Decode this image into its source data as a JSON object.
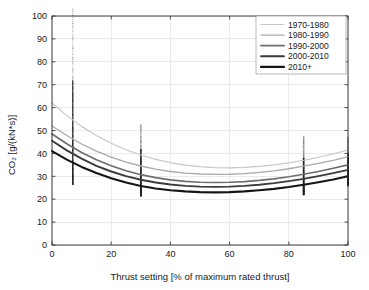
{
  "chart_data": {
    "type": "line",
    "title": "",
    "xlabel": "Thrust setting [% of maximum rated thrust]",
    "ylabel": "CO2 [g/(kN*s)]",
    "ylabel_display": "CO₂ [g/(kN*s)]",
    "xlim": [
      0,
      100
    ],
    "ylim": [
      0,
      100
    ],
    "xticks": [
      0,
      20,
      40,
      60,
      80,
      100
    ],
    "yticks": [
      0,
      10,
      20,
      30,
      40,
      50,
      60,
      70,
      80,
      90,
      100
    ],
    "xtick_labels": [
      "0",
      "20",
      "40",
      "60",
      "80",
      "100"
    ],
    "ytick_labels": [
      "0",
      "10",
      "20",
      "30",
      "40",
      "50",
      "60",
      "70",
      "80",
      "90",
      "100"
    ],
    "grid": true,
    "grid_color": "#d8d8d8",
    "legend_position": "top-right",
    "series": [
      {
        "name": "1970-1980",
        "color": "#c8c8c8",
        "width": 1.2,
        "x": [
          0,
          5,
          10,
          15,
          20,
          25,
          30,
          35,
          40,
          45,
          50,
          55,
          60,
          65,
          70,
          75,
          80,
          85,
          90,
          95,
          100
        ],
        "values": [
          62.0,
          56.5,
          51.8,
          47.8,
          44.4,
          41.6,
          39.3,
          37.4,
          36.0,
          34.9,
          34.2,
          33.8,
          33.7,
          33.9,
          34.3,
          35.0,
          35.9,
          37.0,
          38.3,
          39.8,
          41.5
        ]
      },
      {
        "name": "1980-1990",
        "color": "#aaaaaa",
        "width": 1.3,
        "x": [
          0,
          5,
          10,
          15,
          20,
          25,
          30,
          35,
          40,
          45,
          50,
          55,
          60,
          65,
          70,
          75,
          80,
          85,
          90,
          95,
          100
        ],
        "values": [
          52.0,
          47.8,
          44.1,
          41.0,
          38.4,
          36.2,
          34.5,
          33.1,
          32.1,
          31.4,
          31.0,
          30.8,
          30.9,
          31.2,
          31.7,
          32.4,
          33.3,
          34.4,
          35.6,
          37.0,
          38.6
        ]
      },
      {
        "name": "1990-2000",
        "color": "#6e6e6e",
        "width": 1.7,
        "x": [
          0,
          5,
          10,
          15,
          20,
          25,
          30,
          35,
          40,
          45,
          50,
          55,
          60,
          65,
          70,
          75,
          80,
          85,
          90,
          95,
          100
        ],
        "values": [
          48.5,
          44.2,
          40.4,
          37.2,
          34.6,
          32.4,
          30.7,
          29.4,
          28.4,
          27.8,
          27.4,
          27.3,
          27.4,
          27.7,
          28.2,
          28.9,
          29.8,
          30.9,
          32.1,
          33.5,
          35.0
        ]
      },
      {
        "name": "2000-2010",
        "color": "#3c3c3c",
        "width": 1.9,
        "x": [
          0,
          5,
          10,
          15,
          20,
          25,
          30,
          35,
          40,
          45,
          50,
          55,
          60,
          65,
          70,
          75,
          80,
          85,
          90,
          95,
          100
        ],
        "values": [
          45.5,
          41.3,
          37.7,
          34.6,
          32.1,
          30.1,
          28.5,
          27.3,
          26.4,
          25.8,
          25.5,
          25.4,
          25.5,
          25.8,
          26.3,
          27.0,
          27.9,
          28.9,
          30.1,
          31.4,
          32.8
        ]
      },
      {
        "name": "2010+",
        "color": "#151515",
        "width": 2.1,
        "x": [
          0,
          5,
          10,
          15,
          20,
          25,
          30,
          35,
          40,
          45,
          50,
          55,
          60,
          65,
          70,
          75,
          80,
          85,
          90,
          95,
          100
        ],
        "values": [
          41.0,
          37.3,
          34.1,
          31.4,
          29.1,
          27.3,
          25.8,
          24.7,
          23.9,
          23.4,
          23.1,
          23.0,
          23.1,
          23.4,
          23.9,
          24.5,
          25.3,
          26.3,
          27.4,
          28.6,
          30.0
        ]
      }
    ],
    "scatter_columns": [
      {
        "x": 7,
        "min": 26.5,
        "max": 103.0,
        "dense_min": 28.0,
        "dense_max": 72.0,
        "note": "idle thrust setting data spread"
      },
      {
        "x": 30,
        "min": 21.5,
        "max": 52.5,
        "dense_min": 22.5,
        "dense_max": 42.0,
        "note": "approach thrust setting data spread"
      },
      {
        "x": 85,
        "min": 22.0,
        "max": 47.5,
        "dense_min": 23.0,
        "dense_max": 38.0,
        "note": "climb-out thrust setting data spread"
      },
      {
        "x": 100,
        "min": 26.0,
        "max": 47.0,
        "dense_min": 27.0,
        "dense_max": 40.0,
        "note": "take-off thrust setting data spread"
      }
    ]
  }
}
